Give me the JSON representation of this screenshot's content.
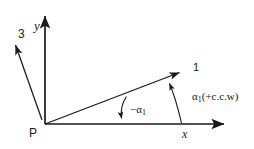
{
  "figure": {
    "background_color": "#ffffff",
    "line_color": "#1a1a1a",
    "width": 254,
    "height": 149
  },
  "labels": {
    "origin": "P",
    "axis_y": "y",
    "axis_x": "x",
    "vector_3": "3",
    "ray_1": "1",
    "angle_negative": "−α",
    "angle_negative_subscript": "1",
    "angle_ccw_symbol": "α",
    "angle_ccw_subscript": "1",
    "angle_ccw_suffix": "(+c.c.w)"
  },
  "geometry": {
    "origin": {
      "x": 45,
      "y": 124
    },
    "y_axis_tip": {
      "x": 45,
      "y": 10
    },
    "x_axis_tip": {
      "x": 230,
      "y": 124
    },
    "ray_1_tip": {
      "x": 186,
      "y": 68
    },
    "ray_1_angle_deg": 22,
    "vector_3_tail": {
      "x": 42,
      "y": 120
    },
    "vector_3_tip": {
      "x": 13,
      "y": 38
    },
    "small_arc_start": {
      "x": 126,
      "y": 97
    },
    "small_arc_end": {
      "x": 122,
      "y": 123
    },
    "large_arc_start": {
      "x": 168,
      "y": 79
    },
    "large_arc_end": {
      "x": 181,
      "y": 123
    }
  }
}
